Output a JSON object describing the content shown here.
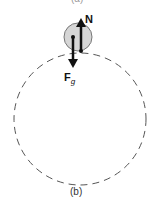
{
  "diagram": {
    "top_caption_partial": "(a)",
    "caption": "(b)",
    "forces": {
      "normal_label": "N",
      "gravity_label_main": "F",
      "gravity_label_sub": "g"
    },
    "colors": {
      "ball_fill": "#d6d6d6",
      "ball_stroke": "#777777",
      "path_stroke": "#555555",
      "arrow": "#111111"
    }
  }
}
